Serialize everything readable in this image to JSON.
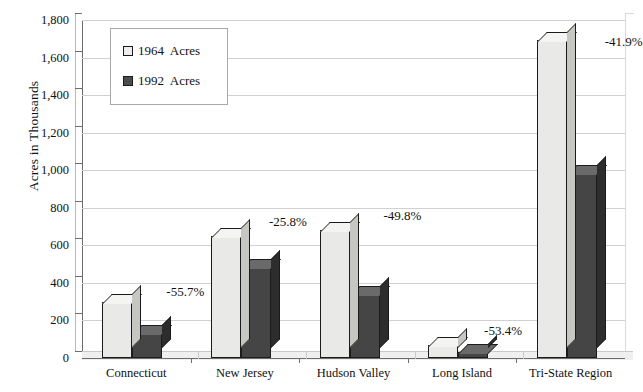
{
  "chart_data": {
    "type": "bar",
    "title": "",
    "subtitle": "",
    "xlabel": "",
    "ylabel": "Acres in Thousands",
    "ylim": [
      0,
      1800
    ],
    "ytick_step": 200,
    "grid": true,
    "legend_position": "upper-left-inside",
    "style": "3d-clustered-column",
    "categories": [
      "Connecticut",
      "New Jersey",
      "Hudson Valley",
      "Long Island",
      "Tri-State Region"
    ],
    "series": [
      {
        "name": "1964  Acres",
        "color": "#e9e9e7",
        "values": [
          298,
          650,
          682,
          70,
          1693
        ]
      },
      {
        "name": "1992  Acres",
        "color": "#454545",
        "values": [
          132,
          482,
          342,
          33,
          984
        ]
      }
    ],
    "ytick_labels": [
      "1,800",
      "1,600",
      "1,400",
      "1,200",
      "1,000",
      "800",
      "600",
      "400",
      "200",
      "0"
    ],
    "ytick_values": [
      1800,
      1600,
      1400,
      1200,
      1000,
      800,
      600,
      400,
      200,
      0
    ],
    "annotations": [
      {
        "category": "Connecticut",
        "text": "-55.7%",
        "value": -55.7
      },
      {
        "category": "New Jersey",
        "text": "-25.8%",
        "value": -25.8
      },
      {
        "category": "Hudson Valley",
        "text": "-49.8%",
        "value": -49.8
      },
      {
        "category": "Long Island",
        "text": "-53.4%",
        "value": -53.4
      },
      {
        "category": "Tri-State Region",
        "text": "-41.9%",
        "value": -41.9
      }
    ],
    "colors": {
      "series_1964": "#e9e9e7",
      "series_1992": "#454545",
      "gridline": "#d0d0d0",
      "axis": "#6d6d6d",
      "text": "#111111",
      "background": "#ffffff"
    }
  },
  "legend": {
    "entries": [
      {
        "label": "1964  Acres"
      },
      {
        "label": "1992  Acres"
      }
    ]
  },
  "axes": {
    "y_title": "Acres in Thousands"
  }
}
